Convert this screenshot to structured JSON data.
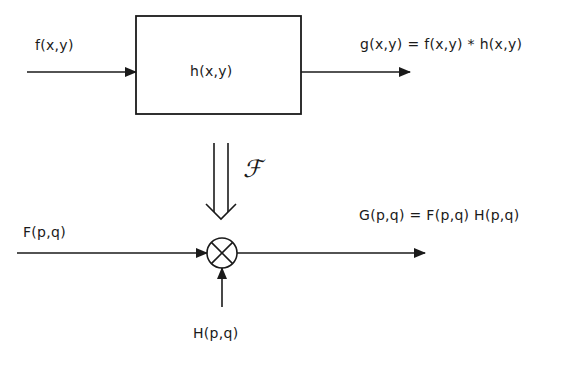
{
  "diagram": {
    "spatial": {
      "input_label": "f(x,y)",
      "system_label": "h(x,y)",
      "output_label": "g(x,y) = f(x,y) * h(x,y)"
    },
    "transform": {
      "symbol": "ℱ",
      "name": "Fourier transform"
    },
    "frequency": {
      "input_label": "F(p,q)",
      "multiplier_symbol": "multiply-circle",
      "second_input_label": "H(p,q)",
      "output_label": "G(p,q) = F(p,q) H(p,q)"
    },
    "colors": {
      "stroke": "#1a1a1a",
      "background": "#ffffff"
    }
  }
}
